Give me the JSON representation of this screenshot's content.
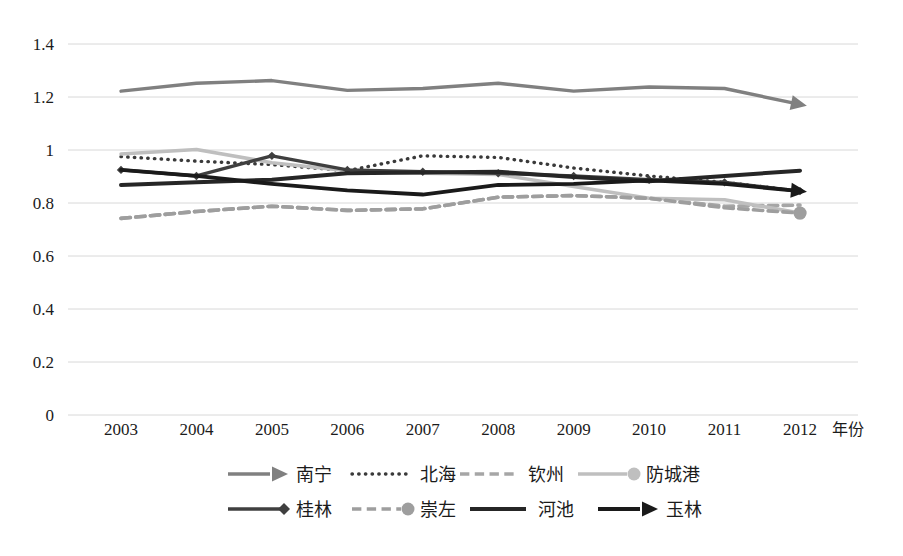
{
  "chart_data": {
    "type": "line",
    "title": "",
    "xlabel": "年份",
    "ylabel": "",
    "grid": true,
    "legend_position": "bottom",
    "x": [
      2003,
      2004,
      2005,
      2006,
      2007,
      2008,
      2009,
      2010,
      2011,
      2012
    ],
    "categories": [
      "2003",
      "2004",
      "2005",
      "2006",
      "2007",
      "2008",
      "2009",
      "2010",
      "2011",
      "2012"
    ],
    "ylim": [
      0,
      1.4
    ],
    "yticks": [
      0,
      0.2,
      0.4,
      0.6,
      0.8,
      1.0,
      1.2,
      1.4
    ],
    "ytick_labels": [
      "0",
      "0.2",
      "0.4",
      "0.6",
      "0.8",
      "1",
      "1.2",
      "1.4"
    ],
    "series": [
      {
        "name": "南宁",
        "color": "#808080",
        "style": "solid",
        "width": 3.4,
        "marker": "arrow",
        "values": [
          1.222,
          1.252,
          1.262,
          1.225,
          1.232,
          1.252,
          1.222,
          1.238,
          1.232,
          1.172
        ]
      },
      {
        "name": "北海",
        "color": "#3a3a3a",
        "style": "dotted",
        "width": 3.4,
        "marker": "none",
        "values": [
          0.975,
          0.958,
          0.945,
          0.922,
          0.978,
          0.972,
          0.932,
          0.902,
          0.878,
          0.845
        ]
      },
      {
        "name": "钦州",
        "color": "#a6a6a6",
        "style": "dashed",
        "width": 3.6,
        "marker": "none",
        "values": [
          0.742,
          0.768,
          0.788,
          0.772,
          0.778,
          0.822,
          0.828,
          0.818,
          0.788,
          0.792
        ]
      },
      {
        "name": "防城港",
        "color": "#bfbfbf",
        "style": "solid",
        "width": 3.6,
        "marker": "circle",
        "values": [
          0.985,
          1.002,
          0.952,
          0.922,
          0.912,
          0.908,
          0.862,
          0.818,
          0.812,
          0.762
        ]
      },
      {
        "name": "桂林",
        "color": "#3f3f3f",
        "style": "solid",
        "width": 3.4,
        "marker": "diamond",
        "values": [
          0.925,
          0.902,
          0.978,
          0.925,
          0.918,
          0.912,
          0.902,
          0.888,
          0.878,
          0.845
        ]
      },
      {
        "name": "崇左",
        "color": "#9e9e9e",
        "style": "dashed",
        "width": 3.6,
        "marker": "circle",
        "values": [
          0.742,
          0.768,
          0.788,
          0.772,
          0.778,
          0.822,
          0.828,
          0.818,
          0.782,
          0.762
        ]
      },
      {
        "name": "河池",
        "color": "#262626",
        "style": "solid",
        "width": 4.0,
        "marker": "none",
        "values": [
          0.868,
          0.878,
          0.888,
          0.912,
          0.915,
          0.918,
          0.898,
          0.882,
          0.902,
          0.922
        ]
      },
      {
        "name": "玉林",
        "color": "#1a1a1a",
        "style": "solid",
        "width": 3.8,
        "marker": "arrow",
        "values": [
          0.925,
          0.902,
          0.872,
          0.848,
          0.832,
          0.868,
          0.872,
          0.885,
          0.872,
          0.845
        ]
      }
    ]
  },
  "legend": {
    "rows": [
      [
        {
          "label": "南宁",
          "series": 0
        },
        {
          "label": "北海",
          "series": 1
        },
        {
          "label": "钦州",
          "series": 2
        },
        {
          "label": "防城港",
          "series": 3
        }
      ],
      [
        {
          "label": "桂林",
          "series": 4
        },
        {
          "label": "崇左",
          "series": 5
        },
        {
          "label": "河池",
          "series": 6
        },
        {
          "label": "玉林",
          "series": 7
        }
      ]
    ]
  },
  "axis": {
    "x_title": "年份"
  }
}
